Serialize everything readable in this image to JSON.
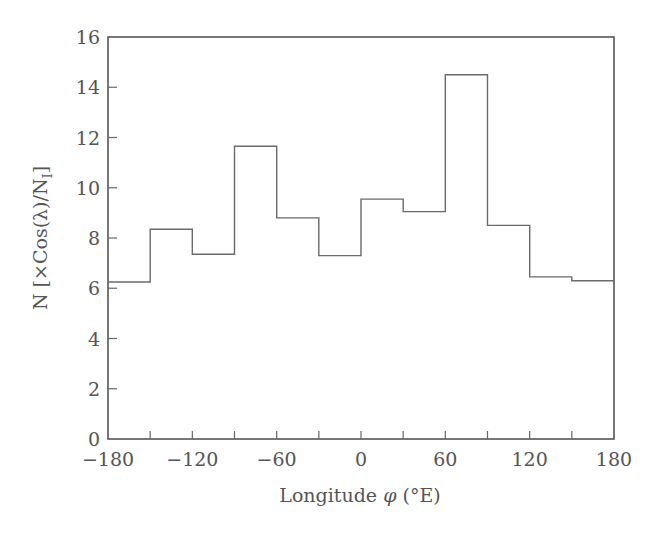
{
  "chart_data": {
    "type": "bar",
    "style": "step-histogram",
    "title": "",
    "xlabel": "Longitude φ (°E)",
    "ylabel": "N [×Cos(λ)/N_I]",
    "xlim": [
      -180,
      180
    ],
    "ylim": [
      0,
      16
    ],
    "grid": false,
    "legend": null,
    "bin_width": 30,
    "bin_edges": [
      -180,
      -150,
      -120,
      -90,
      -60,
      -30,
      0,
      30,
      60,
      90,
      120,
      150,
      180
    ],
    "categories": [
      "-180 to -150",
      "-150 to -120",
      "-120 to -90",
      "-90 to -60",
      "-60 to -30",
      "-30 to 0",
      "0 to 30",
      "30 to 60",
      "60 to 90",
      "90 to 120",
      "120 to 150",
      "150 to 180"
    ],
    "values": [
      6.25,
      8.35,
      7.35,
      11.65,
      8.8,
      7.3,
      9.55,
      9.05,
      14.5,
      8.5,
      6.45,
      6.3
    ],
    "x_ticks": [
      -180,
      -150,
      -120,
      -90,
      -60,
      -30,
      0,
      30,
      60,
      90,
      120,
      150,
      180
    ],
    "x_tick_labels": [
      "−180",
      "−120",
      "−60",
      "0",
      "60",
      "120",
      "180"
    ],
    "x_tick_label_values": [
      -180,
      -120,
      -60,
      0,
      60,
      120,
      180
    ],
    "y_ticks": [
      0,
      2,
      4,
      6,
      8,
      10,
      12,
      14,
      16
    ],
    "y_tick_labels": [
      "0",
      "2",
      "4",
      "6",
      "8",
      "10",
      "12",
      "14",
      "16"
    ]
  },
  "labels": {
    "xlabel_main": "Longitude ",
    "xlabel_symbol": "φ",
    "xlabel_unit": " (°E)",
    "ylabel_n": "N ",
    "ylabel_bracket": "[×Cos(λ)/N",
    "ylabel_sub": "I",
    "ylabel_close": "]"
  },
  "colors": {
    "line": "#6a6a6a",
    "axis": "#555555",
    "text": "#555555",
    "background": "#ffffff"
  }
}
